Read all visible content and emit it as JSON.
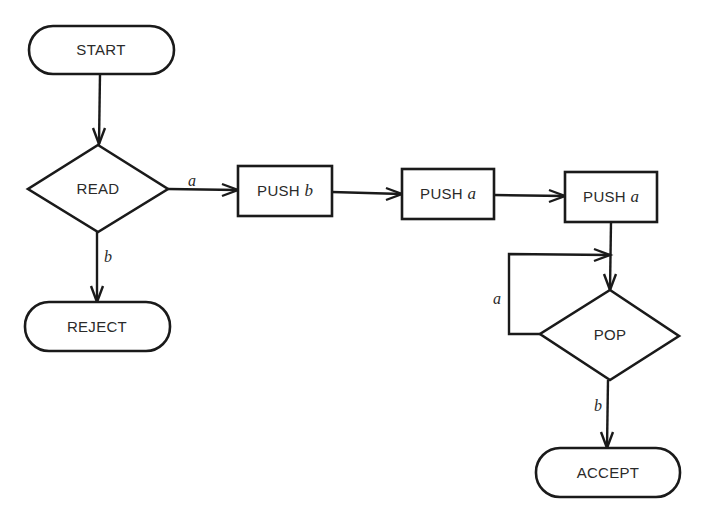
{
  "diagram": {
    "type": "flowchart",
    "nodes": {
      "start": {
        "label": "START",
        "shape": "terminal"
      },
      "read": {
        "label": "READ",
        "shape": "decision"
      },
      "push_b": {
        "op": "PUSH",
        "arg": "b",
        "shape": "process"
      },
      "push_a1": {
        "op": "PUSH",
        "arg": "a",
        "shape": "process"
      },
      "push_a2": {
        "op": "PUSH",
        "arg": "a",
        "shape": "process"
      },
      "pop": {
        "label": "POP",
        "shape": "decision"
      },
      "reject": {
        "label": "REJECT",
        "shape": "terminal"
      },
      "accept": {
        "label": "ACCEPT",
        "shape": "terminal"
      }
    },
    "edges": {
      "start_read": {
        "from": "START",
        "to": "READ",
        "label": ""
      },
      "read_pushb": {
        "from": "READ",
        "to": "PUSH b",
        "label": "a"
      },
      "read_reject": {
        "from": "READ",
        "to": "REJECT",
        "label": "b"
      },
      "pushb_pusha1": {
        "from": "PUSH b",
        "to": "PUSH a",
        "label": ""
      },
      "pusha1_pusha2": {
        "from": "PUSH a",
        "to": "PUSH a",
        "label": ""
      },
      "pusha2_pop": {
        "from": "PUSH a",
        "to": "POP",
        "label": ""
      },
      "pop_loop": {
        "from": "POP",
        "to": "POP",
        "label": "a"
      },
      "pop_accept": {
        "from": "POP",
        "to": "ACCEPT",
        "label": "b"
      }
    },
    "colors": {
      "stroke": "#1a1a1a",
      "text": "#2a2a2a",
      "background": "#ffffff"
    }
  }
}
